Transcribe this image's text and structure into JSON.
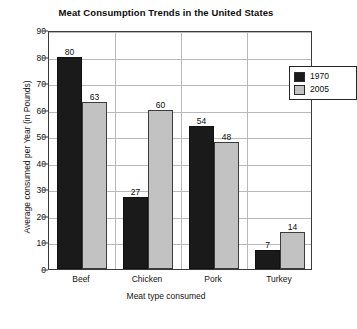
{
  "chart_data": {
    "type": "bar",
    "title": "Meat Consumption Trends in the United States",
    "xlabel": "Meat type consumed",
    "ylabel": "Average consumed per Year (in Pounds)",
    "categories": [
      "Beef",
      "Chicken",
      "Pork",
      "Turkey"
    ],
    "series": [
      {
        "name": "1970",
        "color": "#1a1a1a",
        "values": [
          80,
          27,
          54,
          7
        ]
      },
      {
        "name": "2005",
        "color": "#c2c2c2",
        "values": [
          63,
          60,
          48,
          14
        ]
      }
    ],
    "ylim": [
      0,
      90
    ],
    "yticks": [
      0,
      10,
      20,
      30,
      40,
      50,
      60,
      70,
      80,
      90
    ],
    "ytick_labels": [
      "0",
      "10",
      "20",
      "30",
      "40",
      "50",
      "60",
      "70",
      "80",
      "90"
    ],
    "grid": true,
    "grid_axis": "both",
    "legend_position": "top-right",
    "data_labels": true
  }
}
